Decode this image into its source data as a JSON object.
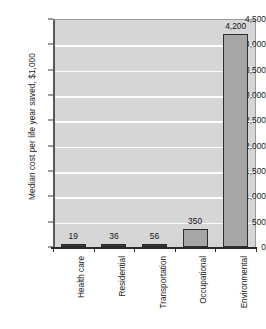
{
  "chart_data": {
    "type": "bar",
    "title": "",
    "xlabel": "",
    "ylabel": "Median cost per life year saved, $1,000",
    "categories": [
      "Health care",
      "Residential",
      "Transportation",
      "Occupational",
      "Environmental"
    ],
    "values": [
      19,
      36,
      56,
      350,
      4200
    ],
    "value_labels": [
      "19",
      "36",
      "56",
      "350",
      "4,200"
    ],
    "ylim": [
      0,
      4500
    ],
    "ytick_values": [
      0,
      500,
      1000,
      1500,
      2000,
      2500,
      3000,
      3500,
      4000,
      4500
    ],
    "ytick_labels": [
      "0",
      "500",
      "1,000",
      "1,500",
      "2,000",
      "2,500",
      "3,000",
      "3,500",
      "4,000",
      "4,500"
    ],
    "grid": true,
    "legend": "none",
    "series": [
      {
        "name": "Median cost per life year saved",
        "values": [
          19,
          36,
          56,
          350,
          4200
        ]
      }
    ],
    "colors": {
      "bar_fill": "#a6a6a6",
      "bar_border": "#2e2e2e",
      "plot_background": "#d6d6d6",
      "gridline": "#fbfbfb",
      "axis": "#2b2b2b",
      "text": "#1a1a1a"
    }
  }
}
